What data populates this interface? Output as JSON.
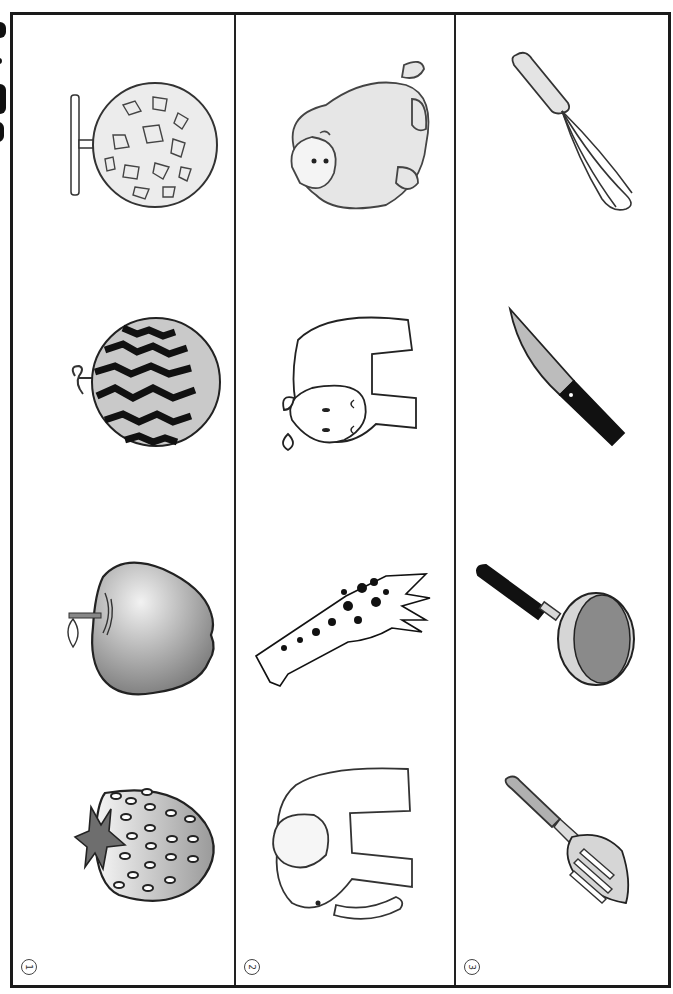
{
  "worksheet": {
    "columns": [
      {
        "number": "1",
        "category": "fruits",
        "items": [
          "melon",
          "watermelon",
          "apple",
          "strawberry"
        ]
      },
      {
        "number": "2",
        "category": "animals",
        "items": [
          "gorilla",
          "hippopotamus",
          "giraffe",
          "elephant"
        ]
      },
      {
        "number": "3",
        "category": "kitchen-tools",
        "items": [
          "whisk",
          "knife",
          "frying-pan",
          "spatula"
        ]
      }
    ],
    "colors": {
      "frame": "#1a1a1a",
      "fill_light": "#d9d9d9",
      "fill_mid": "#a6a6a6",
      "fill_dark": "#111111"
    }
  }
}
